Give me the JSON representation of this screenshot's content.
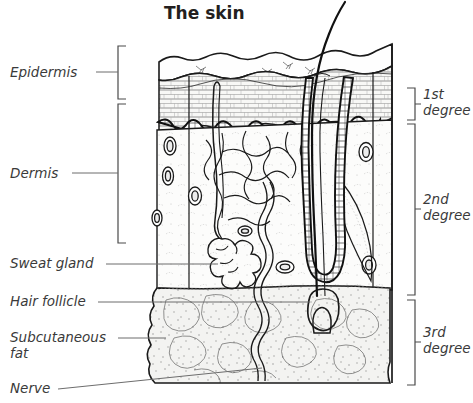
{
  "figure": {
    "title": "The skin",
    "type": "anatomical-cross-section"
  },
  "left_labels": [
    {
      "id": "epidermis",
      "text": "Epidermis",
      "has_bracket": true,
      "line2": ""
    },
    {
      "id": "dermis",
      "text": "Dermis",
      "has_bracket": true,
      "line2": ""
    },
    {
      "id": "sweat-gland",
      "text": "Sweat gland",
      "has_bracket": false,
      "line2": ""
    },
    {
      "id": "hair-follicle",
      "text": "Hair follicle",
      "has_bracket": false,
      "line2": ""
    },
    {
      "id": "subcutaneous-fat",
      "text": "Subcutaneous",
      "has_bracket": false,
      "line2": "fat"
    },
    {
      "id": "nerve",
      "text": "Nerve",
      "has_bracket": false,
      "line2": ""
    }
  ],
  "right_labels": [
    {
      "id": "first-degree",
      "line1": "1st",
      "line2": "degree"
    },
    {
      "id": "second-degree",
      "line1": "2nd",
      "line2": "degree"
    },
    {
      "id": "third-degree",
      "line1": "3rd",
      "line2": "degree"
    }
  ],
  "layers": [
    {
      "id": "epidermis",
      "name": "Epidermis",
      "fill": "#f7f7f5"
    },
    {
      "id": "dermis",
      "name": "Dermis",
      "fill": "#fbfbfa"
    },
    {
      "id": "subcutaneous-fat",
      "name": "Subcutaneous fat",
      "fill": "#f2f2f0"
    }
  ],
  "structures": [
    {
      "id": "hair-shaft",
      "name": "Hair shaft"
    },
    {
      "id": "hair-follicle",
      "name": "Hair follicle"
    },
    {
      "id": "sweat-gland",
      "name": "Sweat gland"
    },
    {
      "id": "sweat-duct",
      "name": "Sweat duct"
    },
    {
      "id": "nerve",
      "name": "Nerve"
    },
    {
      "id": "blood-vessels",
      "name": "Blood vessels"
    },
    {
      "id": "sebaceous-gland",
      "name": "Sebaceous gland"
    }
  ],
  "colors": {
    "ink": "#1a1a1a",
    "text": "#231f20",
    "label": "#3a3a3a",
    "leader": "#6d6d6d",
    "background": "#ffffff"
  }
}
